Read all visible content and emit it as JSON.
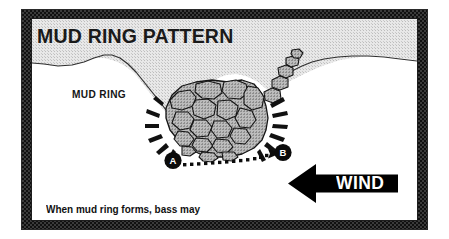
{
  "figure": {
    "title": "MUD RING PATTERN",
    "mud_ring_label": "MUD RING",
    "caption_line_1": "When mud ring forms, bass may",
    "caption_line_2": "relocate from A to B.",
    "wind_label": "WIND",
    "marker_a": "A",
    "marker_b": "B",
    "colors": {
      "frame": "#3b3b3b",
      "panel_background": "#ffffff",
      "mud_ring_fill": "#dcdcdc",
      "rock_fill": "#ababab",
      "ink": "#141414",
      "wind_arrow": "#000000",
      "wind_text": "#ffffff"
    }
  }
}
